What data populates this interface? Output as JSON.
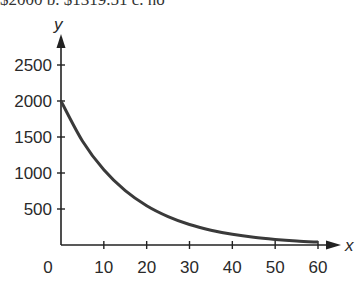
{
  "header_fragment": "$2000    b. $1319.51    c. no",
  "chart_data": {
    "type": "line",
    "title": "",
    "xlabel": "x",
    "ylabel": "y",
    "xlim": [
      0,
      60
    ],
    "ylim": [
      0,
      2500
    ],
    "x_ticks": [
      0,
      10,
      20,
      30,
      40,
      50,
      60
    ],
    "y_ticks": [
      500,
      1000,
      1500,
      2000,
      2500
    ],
    "grid": false,
    "legend": null,
    "series": [
      {
        "name": "exponential decay",
        "x": [
          0,
          5,
          10,
          15,
          20,
          25,
          30,
          35,
          40,
          45,
          50,
          55,
          60
        ],
        "values": [
          2000,
          1445,
          1044,
          754,
          545,
          394,
          284,
          206,
          149,
          107,
          78,
          56,
          40
        ]
      }
    ],
    "line_color": "#3a3a3a",
    "axis_color": "#222222"
  }
}
